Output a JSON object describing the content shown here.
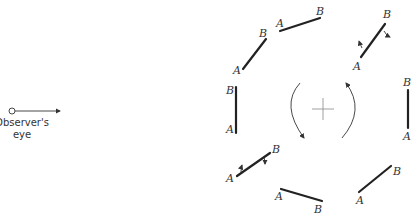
{
  "observer": {
    "label_line1": "Observer's",
    "label_line2": "eye"
  },
  "rod_labels": {
    "r1": {
      "a": "A",
      "b": "B"
    },
    "r2": {
      "a": "A",
      "b": "B"
    },
    "r3": {
      "a": "A",
      "b": "B"
    },
    "r4": {
      "a": "A",
      "b": "B"
    },
    "r5": {
      "a": "A",
      "b": "B"
    },
    "r6": {
      "a": "A",
      "b": "B"
    },
    "r7": {
      "a": "A",
      "b": "B"
    },
    "r8": {
      "a": "A",
      "b": "B"
    }
  },
  "center_symbol": "+",
  "rotation_direction": "counter-clockwise"
}
